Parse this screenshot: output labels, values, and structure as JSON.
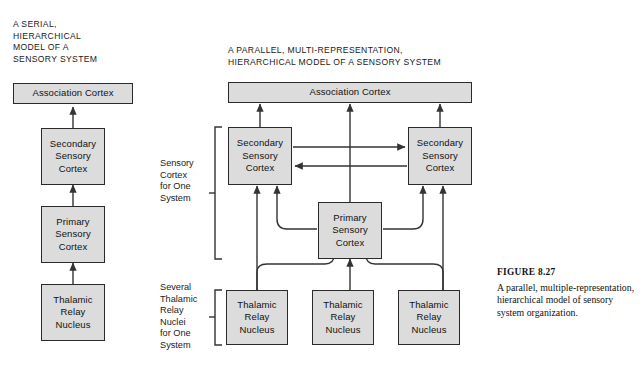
{
  "figure": {
    "number_label": "FIGURE 8.27",
    "caption": "A parallel, multiple-representation, hierarchical model of sensory system organization."
  },
  "colors": {
    "box_fill": "#dcdcdc",
    "box_stroke": "#2a2a2a",
    "wire": "#333333",
    "page_background": "#ffffff",
    "text": "#1a1a1a"
  },
  "serial_model": {
    "title": "A SERIAL,\nHIERARCHICAL\nMODEL OF A\nSENSORY SYSTEM",
    "nodes": [
      {
        "id": "serial-association-cortex",
        "label": "Association Cortex"
      },
      {
        "id": "serial-secondary-sensory-cortex",
        "label": "Secondary\nSensory\nCortex"
      },
      {
        "id": "serial-primary-sensory-cortex",
        "label": "Primary\nSensory\nCortex"
      },
      {
        "id": "serial-thalamic-relay-nucleus",
        "label": "Thalamic\nRelay\nNucleus"
      }
    ],
    "flow": "Thalamic Relay Nucleus -> Primary Sensory Cortex -> Secondary Sensory Cortex -> Association Cortex"
  },
  "parallel_model": {
    "title": "A PARALLEL, MULTI-REPRESENTATION,\nHIERARCHICAL MODEL OF A SENSORY SYSTEM",
    "association_cortex": {
      "id": "parallel-association-cortex",
      "label": "Association Cortex"
    },
    "secondary_left": {
      "id": "parallel-secondary-left",
      "label": "Secondary\nSensory\nCortex"
    },
    "secondary_right": {
      "id": "parallel-secondary-right",
      "label": "Secondary\nSensory\nCortex"
    },
    "primary": {
      "id": "parallel-primary",
      "label": "Primary\nSensory\nCortex"
    },
    "thalamic": [
      {
        "id": "parallel-thalamic-1",
        "label": "Thalamic\nRelay\nNucleus"
      },
      {
        "id": "parallel-thalamic-2",
        "label": "Thalamic\nRelay\nNucleus"
      },
      {
        "id": "parallel-thalamic-3",
        "label": "Thalamic\nRelay\nNucleus"
      }
    ],
    "bracket_labels": {
      "cortex": "Sensory\nCortex\nfor One\nSystem",
      "thalamus": "Several\nThalamic\nRelay\nNuclei\nfor One\nSystem"
    }
  }
}
